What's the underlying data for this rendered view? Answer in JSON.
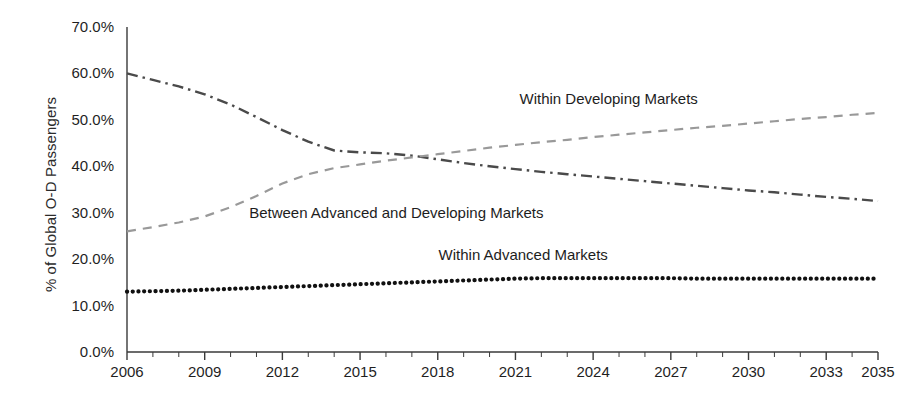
{
  "chart_data": {
    "type": "line",
    "title": "",
    "subtitle": "",
    "xlabel": "",
    "ylabel": "% of Global O-D Passengers",
    "xlim": [
      2006,
      2035
    ],
    "ylim": [
      0,
      70
    ],
    "grid": false,
    "legend_position": "inline-annotations",
    "y_tick_labels": [
      "70.0%",
      "60.0%",
      "50.0%",
      "40.0%",
      "30.0%",
      "20.0%",
      "10.0%",
      "0.0%"
    ],
    "y_tick_values": [
      70,
      60,
      50,
      40,
      30,
      20,
      10,
      0
    ],
    "x_tick_labels": [
      "2006",
      "2009",
      "2012",
      "2015",
      "2018",
      "2021",
      "2024",
      "2027",
      "2030",
      "2033",
      "2035"
    ],
    "x_tick_values": [
      2006,
      2009,
      2012,
      2015,
      2018,
      2021,
      2024,
      2027,
      2030,
      2033,
      2035
    ],
    "x": [
      2006,
      2007,
      2008,
      2009,
      2010,
      2011,
      2012,
      2013,
      2014,
      2015,
      2016,
      2017,
      2018,
      2019,
      2020,
      2021,
      2022,
      2023,
      2024,
      2025,
      2026,
      2027,
      2028,
      2029,
      2030,
      2031,
      2032,
      2033,
      2034,
      2035
    ],
    "series": [
      {
        "name": "Between Advanced and Developing Markets",
        "style": "dash-dot",
        "color": "#4a4a4a",
        "label_x": 2016.4,
        "label_y": 30.0,
        "values": [
          60.0,
          58.6,
          57.2,
          55.5,
          53.3,
          50.6,
          47.8,
          45.3,
          43.4,
          43.0,
          42.8,
          42.3,
          41.5,
          40.7,
          40.0,
          39.4,
          38.8,
          38.3,
          37.8,
          37.3,
          36.8,
          36.3,
          35.8,
          35.3,
          34.8,
          34.4,
          33.9,
          33.4,
          33.0,
          32.5
        ]
      },
      {
        "name": "Within Developing Markets",
        "style": "dashed",
        "color": "#999999",
        "label_x": 2024.6,
        "label_y": 54.5,
        "values": [
          26.0,
          26.9,
          27.9,
          29.2,
          31.2,
          33.6,
          36.3,
          38.3,
          39.6,
          40.4,
          41.2,
          41.9,
          42.6,
          43.3,
          44.0,
          44.6,
          45.2,
          45.7,
          46.3,
          46.8,
          47.3,
          47.8,
          48.3,
          48.7,
          49.2,
          49.7,
          50.2,
          50.6,
          51.1,
          51.5
        ]
      },
      {
        "name": "Within Advanced Markets",
        "style": "dotted",
        "color": "#111111",
        "label_x": 2021.3,
        "label_y": 21.0,
        "values": [
          13.0,
          13.1,
          13.2,
          13.4,
          13.6,
          13.8,
          14.0,
          14.2,
          14.4,
          14.6,
          14.8,
          15.0,
          15.2,
          15.4,
          15.6,
          15.8,
          15.9,
          15.9,
          15.9,
          15.9,
          15.9,
          15.9,
          15.8,
          15.8,
          15.8,
          15.8,
          15.8,
          15.8,
          15.8,
          15.8
        ]
      }
    ]
  },
  "axes": {
    "axis_color": "#3a3a3a",
    "background": "#ffffff"
  }
}
